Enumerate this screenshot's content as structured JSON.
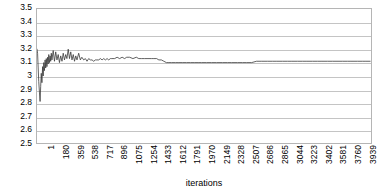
{
  "chart_data": {
    "type": "line",
    "title": "",
    "xlabel": "iterations",
    "ylabel": "",
    "grid": true,
    "legend": false,
    "ylim": [
      2.5,
      3.5
    ],
    "xlim": [
      1,
      4000
    ],
    "y_ticks": [
      "3.5",
      "3.4",
      "3.3",
      "3.2",
      "3.1",
      "3",
      "2.9",
      "2.8",
      "2.7",
      "2.6",
      "2.5"
    ],
    "y_tick_values": [
      3.5,
      3.4,
      3.3,
      3.2,
      3.1,
      3.0,
      2.9,
      2.8,
      2.7,
      2.6,
      2.5
    ],
    "x_ticks": [
      "1",
      "180",
      "359",
      "538",
      "717",
      "896",
      "1075",
      "1254",
      "1433",
      "1612",
      "1791",
      "1970",
      "2149",
      "2328",
      "2507",
      "2686",
      "2865",
      "3044",
      "3223",
      "3402",
      "3581",
      "3760",
      "3939"
    ],
    "x_tick_values": [
      1,
      180,
      359,
      538,
      717,
      896,
      1075,
      1254,
      1433,
      1612,
      1791,
      1970,
      2149,
      2328,
      2507,
      2686,
      2865,
      3044,
      3223,
      3402,
      3581,
      3760,
      3939
    ],
    "line_color": "#3a3a3a",
    "grid_color": "#c4c4c4",
    "border_color": "#b5b5b5",
    "background_color": "#ffffff",
    "series": [
      {
        "name": "value",
        "x": [
          1,
          8,
          15,
          22,
          30,
          38,
          45,
          52,
          60,
          68,
          75,
          82,
          90,
          98,
          105,
          112,
          120,
          128,
          135,
          142,
          150,
          158,
          165,
          172,
          180,
          195,
          210,
          225,
          240,
          255,
          270,
          285,
          300,
          315,
          330,
          345,
          359,
          375,
          390,
          405,
          420,
          435,
          450,
          465,
          480,
          500,
          520,
          538,
          560,
          580,
          600,
          620,
          640,
          660,
          680,
          700,
          717,
          740,
          760,
          780,
          800,
          820,
          840,
          860,
          880,
          896,
          930,
          960,
          990,
          1020,
          1050,
          1075,
          1110,
          1150,
          1190,
          1220,
          1254,
          1290,
          1330,
          1370,
          1400,
          1433,
          1460,
          1490,
          1520,
          1550,
          1580,
          1612,
          1660,
          1700,
          1740,
          1791,
          1840,
          1890,
          1930,
          1970,
          2030,
          2090,
          2149,
          2220,
          2280,
          2328,
          2400,
          2460,
          2507,
          2570,
          2630,
          2686,
          2760,
          2820,
          2865,
          2940,
          3000,
          3044,
          3120,
          3180,
          3223,
          3300,
          3360,
          3402,
          3480,
          3540,
          3581,
          3660,
          3720,
          3760,
          3840,
          3900,
          3939,
          3990
        ],
        "y": [
          3.2,
          3.17,
          3.06,
          2.96,
          2.88,
          2.81,
          2.92,
          3.02,
          2.95,
          3.07,
          3.0,
          3.1,
          3.04,
          3.12,
          3.06,
          3.13,
          3.07,
          3.14,
          3.09,
          3.16,
          3.1,
          3.15,
          3.11,
          3.17,
          3.12,
          3.19,
          3.11,
          3.18,
          3.12,
          3.16,
          3.1,
          3.15,
          3.11,
          3.17,
          3.12,
          3.16,
          3.13,
          3.2,
          3.13,
          3.18,
          3.12,
          3.16,
          3.11,
          3.15,
          3.12,
          3.17,
          3.12,
          3.14,
          3.12,
          3.13,
          3.11,
          3.13,
          3.12,
          3.12,
          3.11,
          3.12,
          3.12,
          3.12,
          3.13,
          3.12,
          3.13,
          3.12,
          3.13,
          3.12,
          3.13,
          3.13,
          3.13,
          3.14,
          3.13,
          3.14,
          3.13,
          3.14,
          3.14,
          3.13,
          3.14,
          3.13,
          3.13,
          3.13,
          3.13,
          3.13,
          3.13,
          3.13,
          3.12,
          3.12,
          3.11,
          3.1,
          3.1,
          3.1,
          3.1,
          3.1,
          3.1,
          3.1,
          3.1,
          3.1,
          3.1,
          3.1,
          3.1,
          3.1,
          3.1,
          3.1,
          3.1,
          3.1,
          3.1,
          3.1,
          3.1,
          3.1,
          3.11,
          3.11,
          3.11,
          3.11,
          3.11,
          3.11,
          3.11,
          3.11,
          3.11,
          3.11,
          3.11,
          3.11,
          3.11,
          3.11,
          3.11,
          3.11,
          3.11,
          3.11,
          3.11,
          3.11,
          3.11,
          3.11,
          3.11,
          3.11
        ]
      }
    ]
  }
}
